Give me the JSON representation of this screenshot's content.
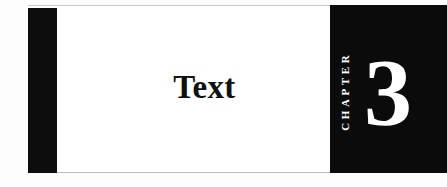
{
  "page": {
    "kind": "chapter-opening-page",
    "background_color": "#ffffff"
  },
  "banner": {
    "black_color": "#0b0b0b",
    "field_color": "#ffffff",
    "rule_color": "#c9c9c9"
  },
  "chapter": {
    "title": "Text",
    "label": "CHAPTER",
    "number": "3",
    "title_color": "#111111",
    "label_color": "#ffffff",
    "number_color": "#ffffff"
  }
}
